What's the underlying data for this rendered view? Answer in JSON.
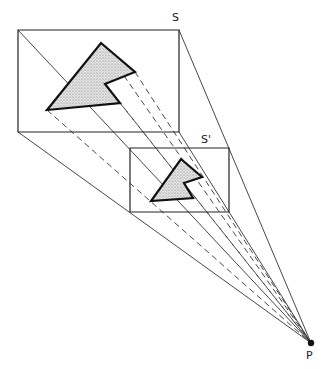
{
  "labels": {
    "screen_s": "S",
    "screen_s_prime": "S'",
    "projection_point": "P"
  },
  "colors": {
    "line": "#222222",
    "fill": "#c8c8c8",
    "background": "#ffffff"
  },
  "geometry": {
    "point_p": [
      311,
      343
    ],
    "rect_s": [
      [
        18,
        30
      ],
      [
        179,
        30
      ],
      [
        179,
        132
      ],
      [
        18,
        132
      ]
    ],
    "rect_s_prime": [
      [
        130,
        148
      ],
      [
        229,
        148
      ],
      [
        229,
        212
      ],
      [
        130,
        212
      ]
    ],
    "shape_on_s": [
      [
        101,
        43
      ],
      [
        135,
        72
      ],
      [
        105,
        84
      ],
      [
        120,
        103
      ],
      [
        47,
        110
      ]
    ],
    "shape_on_s_prime": [
      [
        181,
        159
      ],
      [
        202,
        177
      ],
      [
        184,
        183
      ],
      [
        193,
        198
      ],
      [
        151,
        201
      ]
    ]
  }
}
